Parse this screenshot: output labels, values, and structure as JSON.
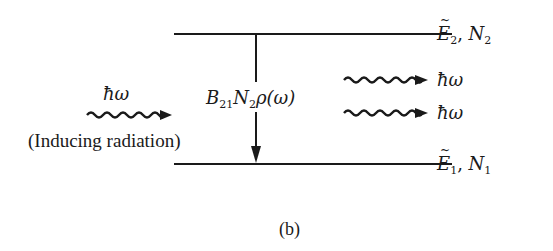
{
  "diagram": {
    "caption": "(b)",
    "colors": {
      "ink": "#1a1a1a",
      "background": "#ffffff"
    },
    "levels": [
      {
        "id": "upper",
        "energy_symbol": "E",
        "energy_subscript": "2",
        "separator": ",",
        "population_symbol": "N",
        "population_subscript": "2"
      },
      {
        "id": "lower",
        "energy_symbol": "E",
        "energy_subscript": "1",
        "separator": ",",
        "population_symbol": "N",
        "population_subscript": "1"
      }
    ],
    "transition": {
      "direction": "down",
      "rate_label": {
        "coeff": "B",
        "coeff_sub": "21",
        "pop": "N",
        "pop_sub": "2",
        "density": "ρ(ω)"
      }
    },
    "incident_photon": {
      "label": "ħω",
      "description": "(Inducing radiation)"
    },
    "emitted_photons": [
      {
        "label": "ħω"
      },
      {
        "label": "ħω"
      }
    ]
  }
}
